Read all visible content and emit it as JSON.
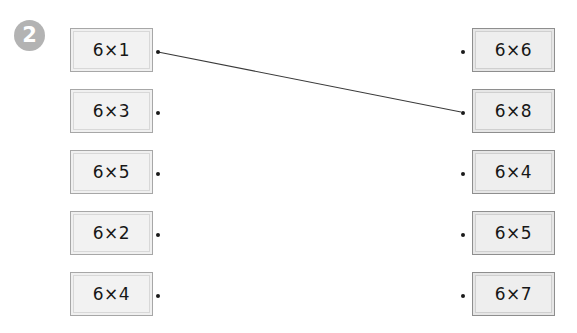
{
  "worksheet": {
    "question_number": "2",
    "background_color": "#ffffff",
    "width": 577,
    "height": 333
  },
  "left_column": {
    "name": "left-cards",
    "cards": [
      {
        "expr": "6×1",
        "x": 70,
        "y": 28,
        "dot_x": 156,
        "dot_y": 50
      },
      {
        "expr": "6×3",
        "x": 70,
        "y": 89,
        "dot_x": 156,
        "dot_y": 111
      },
      {
        "expr": "6×5",
        "x": 70,
        "y": 150,
        "dot_x": 156,
        "dot_y": 172
      },
      {
        "expr": "6×2",
        "x": 70,
        "y": 211,
        "dot_x": 156,
        "dot_y": 233
      },
      {
        "expr": "6×4",
        "x": 70,
        "y": 272,
        "dot_x": 156,
        "dot_y": 294
      }
    ]
  },
  "right_column": {
    "name": "right-cards",
    "cards": [
      {
        "expr": "6×6",
        "x": 472,
        "y": 28,
        "dot_x": 461,
        "dot_y": 50
      },
      {
        "expr": "6×8",
        "x": 472,
        "y": 89,
        "dot_x": 461,
        "dot_y": 111
      },
      {
        "expr": "6×4",
        "x": 472,
        "y": 150,
        "dot_x": 461,
        "dot_y": 172
      },
      {
        "expr": "6×5",
        "x": 472,
        "y": 211,
        "dot_x": 461,
        "dot_y": 233
      },
      {
        "expr": "6×7",
        "x": 472,
        "y": 272,
        "dot_x": 461,
        "dot_y": 294
      }
    ]
  },
  "connections": [
    {
      "from": "6×1",
      "to": "6×8",
      "x1": 158,
      "y1": 52,
      "x2": 461,
      "y2": 112,
      "color": "#3a3a3a"
    }
  ],
  "colors": {
    "card_border_left": "#a7a7a7",
    "card_border_right": "#8e8e8e",
    "card_fill": "#f1f1f1",
    "badge_fill": "#b3b3b3",
    "text": "#171717",
    "line": "#3a3a3a"
  }
}
